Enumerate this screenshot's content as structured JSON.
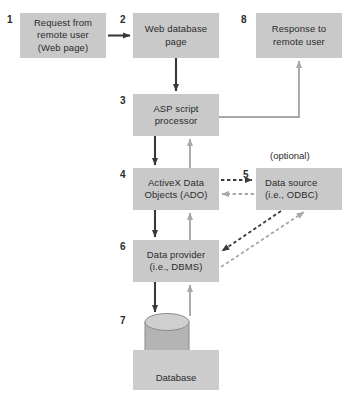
{
  "diagram": {
    "nodes": [
      {
        "id": "request",
        "number": "1",
        "lines": [
          "Request from",
          "remote user",
          "(Web page)"
        ],
        "x": 20,
        "y": 13,
        "w": 86,
        "h": 45,
        "align": "center"
      },
      {
        "id": "web-database-page",
        "number": "2",
        "lines": [
          "Web database",
          "page"
        ],
        "x": 133,
        "y": 13,
        "w": 86,
        "h": 45,
        "align": "center"
      },
      {
        "id": "response",
        "number": "8",
        "lines": [
          "Response to",
          "remote user"
        ],
        "x": 256,
        "y": 13,
        "w": 86,
        "h": 45,
        "align": "center"
      },
      {
        "id": "asp-script-processor",
        "number": "3",
        "lines": [
          "ASP script",
          "processor"
        ],
        "x": 133,
        "y": 94,
        "w": 86,
        "h": 42,
        "align": "center"
      },
      {
        "id": "ado",
        "number": "4",
        "lines": [
          "ActiveX Data",
          "Objects (ADO)"
        ],
        "x": 133,
        "y": 168,
        "w": 86,
        "h": 42,
        "align": "center"
      },
      {
        "id": "data-source",
        "number": "5",
        "lines": [
          "Data source",
          "(i.e., ODBC)"
        ],
        "x": 256,
        "y": 168,
        "w": 86,
        "h": 42,
        "align": "left"
      },
      {
        "id": "data-provider",
        "number": "6",
        "lines": [
          "Data provider",
          "(i.e., DBMS)"
        ],
        "x": 133,
        "y": 240,
        "w": 86,
        "h": 42,
        "align": "center"
      }
    ],
    "database": {
      "number": "7",
      "label": "Database",
      "plate": {
        "x": 133,
        "y": 350,
        "w": 86,
        "h": 40
      }
    },
    "annotations": [
      {
        "id": "optional-note",
        "text": "(optional)",
        "x": 270,
        "y": 150
      }
    ],
    "colors": {
      "node_fill": "#c9c9c9",
      "plate_fill": "#cdcdcd",
      "arrow_dark": "#3a3a3a",
      "arrow_light": "#a8a8a8",
      "cylinder_fill": "#b4b4b4",
      "cylinder_top": "#cfcfcf",
      "text": "#2b2b2b"
    }
  }
}
